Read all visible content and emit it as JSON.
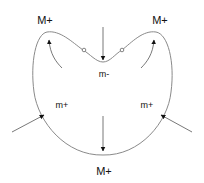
{
  "diagram": {
    "labels": {
      "top_left": "M+",
      "top_right": "M+",
      "bottom": "M+",
      "center": "m-",
      "mid_left": "m+",
      "mid_right": "m+"
    },
    "colors": {
      "curve": "#8a8a8a",
      "arrow": "#111111",
      "thin_arrow_shaft": "#666666",
      "text": "#111111"
    }
  }
}
